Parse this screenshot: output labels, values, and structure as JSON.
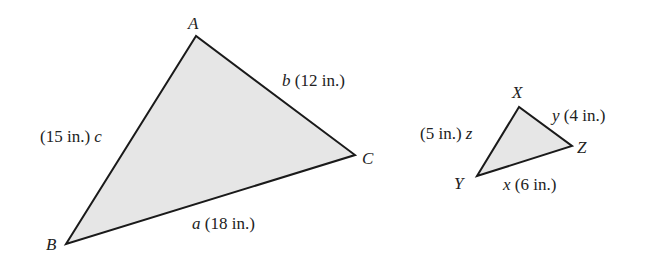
{
  "triangle_abc": {
    "vertices": {
      "A": "A",
      "B": "B",
      "C": "C"
    },
    "sides": {
      "a": {
        "var": "a",
        "length": "(18 in.)"
      },
      "b": {
        "var": "b",
        "length": "(12 in.)"
      },
      "c": {
        "var": "c",
        "length": "(15 in.)"
      }
    }
  },
  "triangle_xyz": {
    "vertices": {
      "X": "X",
      "Y": "Y",
      "Z": "Z"
    },
    "sides": {
      "x": {
        "var": "x",
        "length": "(6 in.)"
      },
      "y": {
        "var": "y",
        "length": "(4 in.)"
      },
      "z": {
        "var": "z",
        "length": "(5 in.)"
      }
    }
  },
  "colors": {
    "fill": "#e6e6e6",
    "stroke": "#1a1a1a"
  }
}
